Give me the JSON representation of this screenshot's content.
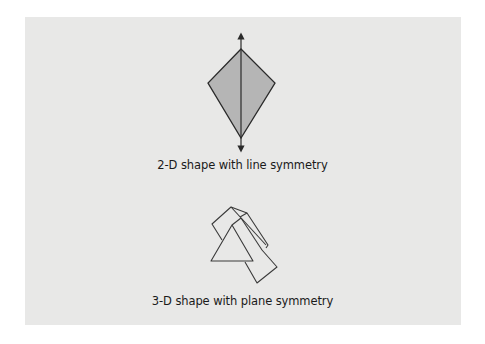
{
  "figure": {
    "panel_color": "#e8e8e7",
    "stroke_color": "#2a2a2a",
    "fill_color": "#b5b5b5",
    "items": [
      {
        "id": "kite",
        "caption": "2-D shape with line symmetry",
        "vertices": {
          "top": [
            241,
            49
          ],
          "right": [
            275,
            83
          ],
          "bottom": [
            241,
            138
          ],
          "left": [
            208,
            83
          ]
        },
        "symmetry_axis": {
          "from": [
            241,
            33
          ],
          "to": [
            241,
            152
          ],
          "arrowheads": "both"
        }
      },
      {
        "id": "prism",
        "caption": "3-D shape with plane symmetry"
      }
    ]
  }
}
